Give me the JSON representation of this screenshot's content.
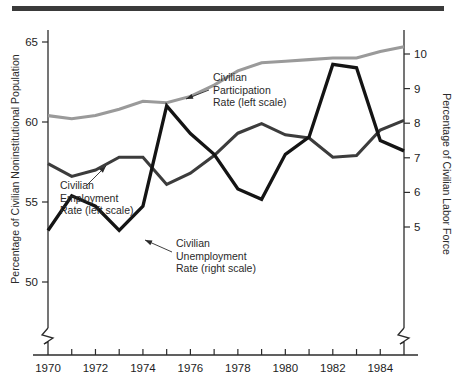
{
  "figure": {
    "background_color": "#ffffff",
    "top_rule_color": "#3a3a3a"
  },
  "chart_data": {
    "type": "line",
    "title": "",
    "subtitle": "",
    "xlabel": "",
    "ylabel": "Percentage of Civilian Noninstitutional Population",
    "y2label": "Percentage of Civilian Labor Force",
    "grid": false,
    "legend_position": "inline-annotations",
    "xlim": [
      1970,
      1985
    ],
    "xticks": [
      1970,
      1971,
      1972,
      1973,
      1974,
      1975,
      1976,
      1977,
      1978,
      1979,
      1980,
      1981,
      1982,
      1983,
      1984,
      1985
    ],
    "xticklabels": [
      "1970",
      "",
      "1972",
      "",
      "1974",
      "",
      "1976",
      "",
      "1978",
      "",
      "1980",
      "",
      "1982",
      "",
      "1984",
      ""
    ],
    "ylim": [
      48.5,
      66.0
    ],
    "yticks": [
      50,
      55,
      60,
      65
    ],
    "yticklabels": [
      "50",
      "55",
      "60",
      "65"
    ],
    "y2lim": [
      4.3,
      10.8
    ],
    "y2ticks": [
      5,
      6,
      7,
      8,
      9,
      10
    ],
    "y2ticklabels": [
      "5",
      "6",
      "7",
      "8",
      "9",
      "10"
    ],
    "axis_break": true,
    "x": [
      1970,
      1971,
      1972,
      1973,
      1974,
      1975,
      1976,
      1977,
      1978,
      1979,
      1980,
      1981,
      1982,
      1983,
      1984,
      1985
    ],
    "series": [
      {
        "name": "Civilian Participation Rate",
        "scale": "left",
        "color": "#9a9a9a",
        "width": 3.1,
        "values": [
          60.4,
          60.2,
          60.4,
          60.8,
          61.3,
          61.2,
          61.6,
          62.3,
          63.2,
          63.7,
          63.8,
          63.9,
          64.0,
          64.0,
          64.4,
          64.7
        ]
      },
      {
        "name": "Civilian Employment Rate",
        "scale": "left",
        "color": "#3c3c3c",
        "width": 3.1,
        "values": [
          57.4,
          56.6,
          57.0,
          57.8,
          57.8,
          56.1,
          56.8,
          57.9,
          59.3,
          59.9,
          59.2,
          59.0,
          57.8,
          57.9,
          59.5,
          60.1
        ]
      },
      {
        "name": "Civilian Unemployment Rate",
        "scale": "right",
        "color": "#141414",
        "width": 3.3,
        "values": [
          4.9,
          5.9,
          5.6,
          4.9,
          5.6,
          8.5,
          7.7,
          7.1,
          6.1,
          5.8,
          7.1,
          7.6,
          9.7,
          9.6,
          7.5,
          7.2
        ]
      }
    ],
    "annotations": [
      {
        "name": "participation-annotation",
        "lines": [
          "Civilian",
          "Participation",
          "Rate (left scale)"
        ],
        "text_x": 213,
        "text_y": 81,
        "arrow_from": [
          209,
          90
        ],
        "arrow_to": [
          186,
          99
        ]
      },
      {
        "name": "employment-annotation",
        "lines": [
          "Civilian",
          "Employment",
          "Rate (left scale)"
        ],
        "text_x": 60,
        "text_y": 189,
        "arrow_from": [
          87,
          185
        ],
        "arrow_to": [
          106,
          166
        ]
      },
      {
        "name": "unemployment-annotation",
        "lines": [
          "Civilian",
          "Unemployment",
          "Rate (right scale)"
        ],
        "text_x": 176,
        "text_y": 247,
        "arrow_from": [
          172,
          252
        ],
        "arrow_to": [
          145,
          240
        ]
      }
    ]
  }
}
